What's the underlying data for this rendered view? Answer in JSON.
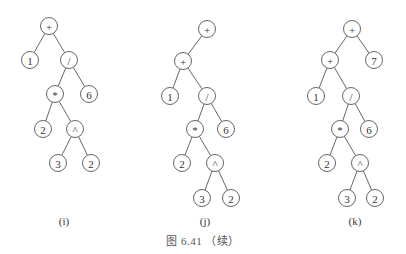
{
  "node_radius": 8.5,
  "trees": [
    {
      "label": "(i)",
      "label_pos": [
        64,
        222
      ],
      "nodes": [
        {
          "id": "a",
          "text": "+",
          "x": 49,
          "y": 26
        },
        {
          "id": "b",
          "text": "1",
          "x": 30,
          "y": 60
        },
        {
          "id": "c",
          "text": "/",
          "x": 69,
          "y": 60
        },
        {
          "id": "d",
          "text": "*",
          "x": 55,
          "y": 94
        },
        {
          "id": "e",
          "text": "6",
          "x": 89,
          "y": 94
        },
        {
          "id": "f",
          "text": "2",
          "x": 43,
          "y": 129
        },
        {
          "id": "g",
          "text": "^",
          "x": 75,
          "y": 129
        },
        {
          "id": "h",
          "text": "3",
          "x": 58,
          "y": 163
        },
        {
          "id": "k",
          "text": "2",
          "x": 91,
          "y": 163
        }
      ],
      "edges": [
        [
          "a",
          "b"
        ],
        [
          "a",
          "c"
        ],
        [
          "c",
          "d"
        ],
        [
          "c",
          "e"
        ],
        [
          "d",
          "f"
        ],
        [
          "d",
          "g"
        ],
        [
          "g",
          "h"
        ],
        [
          "g",
          "k"
        ]
      ]
    },
    {
      "label": "(j)",
      "label_pos": [
        205,
        222
      ],
      "nodes": [
        {
          "id": "r",
          "text": "+",
          "x": 207,
          "y": 29
        },
        {
          "id": "a",
          "text": "+",
          "x": 183,
          "y": 61
        },
        {
          "id": "b",
          "text": "1",
          "x": 170,
          "y": 96
        },
        {
          "id": "c",
          "text": "/",
          "x": 207,
          "y": 96
        },
        {
          "id": "d",
          "text": "*",
          "x": 195,
          "y": 129
        },
        {
          "id": "e",
          "text": "6",
          "x": 226,
          "y": 129
        },
        {
          "id": "f",
          "text": "2",
          "x": 182,
          "y": 163
        },
        {
          "id": "g",
          "text": "^",
          "x": 215,
          "y": 163
        },
        {
          "id": "h",
          "text": "3",
          "x": 202,
          "y": 198
        },
        {
          "id": "k",
          "text": "2",
          "x": 231,
          "y": 198
        }
      ],
      "edges": [
        [
          "r",
          "a"
        ],
        [
          "a",
          "b"
        ],
        [
          "a",
          "c"
        ],
        [
          "c",
          "d"
        ],
        [
          "c",
          "e"
        ],
        [
          "d",
          "f"
        ],
        [
          "d",
          "g"
        ],
        [
          "g",
          "h"
        ],
        [
          "g",
          "k"
        ]
      ]
    },
    {
      "label": "(k)",
      "label_pos": [
        355,
        222
      ],
      "nodes": [
        {
          "id": "r",
          "text": "+",
          "x": 352,
          "y": 29
        },
        {
          "id": "a",
          "text": "+",
          "x": 330,
          "y": 60
        },
        {
          "id": "s",
          "text": "7",
          "x": 374,
          "y": 60
        },
        {
          "id": "b",
          "text": "1",
          "x": 316,
          "y": 96
        },
        {
          "id": "c",
          "text": "/",
          "x": 351,
          "y": 96
        },
        {
          "id": "d",
          "text": "*",
          "x": 340,
          "y": 129
        },
        {
          "id": "e",
          "text": "6",
          "x": 369,
          "y": 129
        },
        {
          "id": "f",
          "text": "2",
          "x": 327,
          "y": 163
        },
        {
          "id": "g",
          "text": "^",
          "x": 360,
          "y": 163
        },
        {
          "id": "h",
          "text": "3",
          "x": 347,
          "y": 198
        },
        {
          "id": "k",
          "text": "2",
          "x": 375,
          "y": 198
        }
      ],
      "edges": [
        [
          "r",
          "a"
        ],
        [
          "r",
          "s"
        ],
        [
          "a",
          "b"
        ],
        [
          "a",
          "c"
        ],
        [
          "c",
          "d"
        ],
        [
          "c",
          "e"
        ],
        [
          "d",
          "f"
        ],
        [
          "d",
          "g"
        ],
        [
          "g",
          "h"
        ],
        [
          "g",
          "k"
        ]
      ]
    }
  ],
  "caption": {
    "text": "图 6.41 （续）",
    "pos": [
      203,
      239
    ]
  }
}
